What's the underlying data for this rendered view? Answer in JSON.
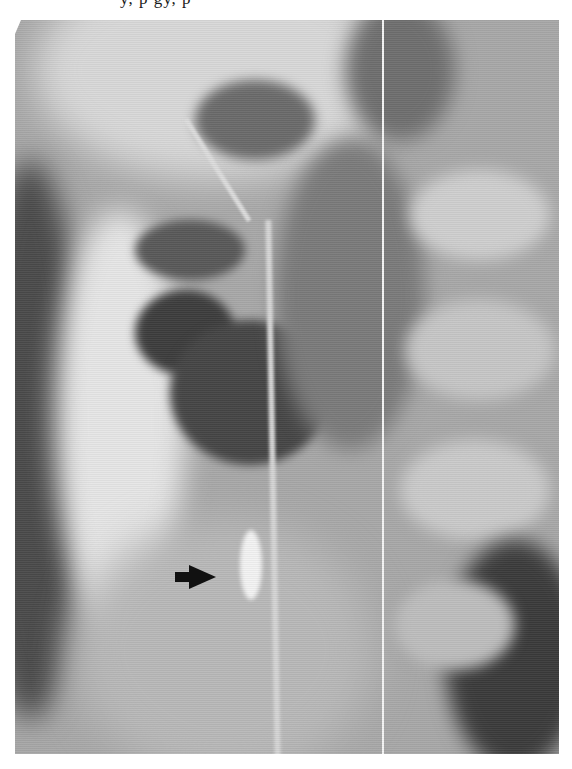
{
  "page": {
    "clipped_header_text": "y, p          gy,    p"
  },
  "figure": {
    "type": "radiograph",
    "annotation": {
      "icon": "arrow-right-icon",
      "color": "#111111"
    },
    "colors": {
      "background": "#ffffff",
      "film_base": "#a8a8a8",
      "dark_gas": "#3c3c3c",
      "bright_contrast": "#efefef"
    }
  }
}
